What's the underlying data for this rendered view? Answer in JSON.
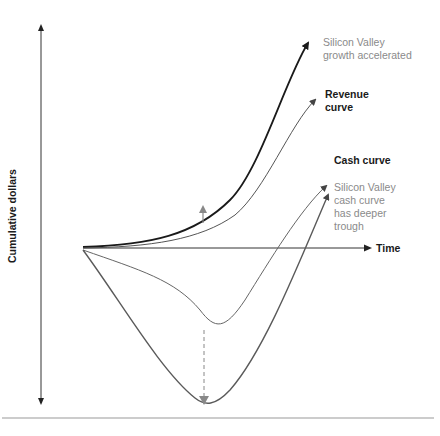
{
  "diagram": {
    "y_axis_label": "Cumulative dollars",
    "x_axis_label": "Time",
    "labels": {
      "sv_growth": [
        "Silicon Valley",
        "growth accelerated"
      ],
      "revenue": [
        "Revenue",
        "curve"
      ],
      "cash": [
        "Cash curve"
      ],
      "sv_cash": [
        "Silicon Valley",
        "cash curve",
        "has deeper",
        "trough"
      ]
    },
    "colors": {
      "sv_growth_curve": "#1a1a1a",
      "revenue_curve": "#555555",
      "cash_curve": "#666666",
      "sv_cash_curve": "#5a5a5a",
      "axis": "#333333",
      "annotation_arrow": "#888888",
      "separator": "#999999",
      "grey_label": "#8a8a8a"
    }
  }
}
